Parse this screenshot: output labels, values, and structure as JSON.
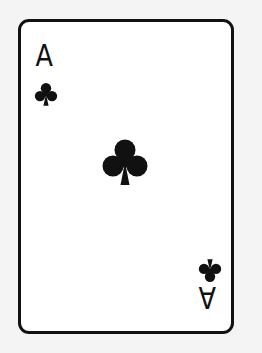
{
  "card": {
    "rank": "A",
    "suit": "clubs",
    "suit_icon": "club-icon",
    "color": "#111111",
    "background": "#ffffff"
  }
}
